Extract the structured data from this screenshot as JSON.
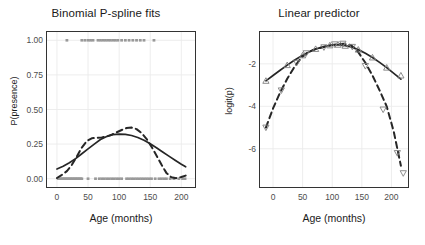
{
  "figure": {
    "background": "#ffffff",
    "panel_border": "#333333",
    "grid_color": "#ebebeb",
    "curve_color": "#262626",
    "rug_color": "#999999",
    "marker_color": "#808080"
  },
  "chart_data": [
    {
      "type": "line",
      "panel": "left",
      "title": "Binomial P-spline fits",
      "xlabel": "Age (months)",
      "ylabel": "P(presence)",
      "xlim": [
        -16,
        222
      ],
      "ylim": [
        -0.06,
        1.06
      ],
      "xticks": [
        0,
        50,
        100,
        150,
        200
      ],
      "xticklabels": [
        "0",
        "50",
        "100",
        "150",
        "200"
      ],
      "yticks": [
        0.0,
        0.25,
        0.5,
        0.75,
        1.0
      ],
      "yticklabels": [
        "0.00",
        "0.25",
        "0.50",
        "0.75",
        "1.00"
      ],
      "grid": true,
      "legend": "none",
      "series": [
        {
          "name": "smooth-fit",
          "style": "solid",
          "x": [
            0,
            10,
            20,
            30,
            40,
            50,
            60,
            70,
            80,
            90,
            100,
            110,
            120,
            130,
            140,
            150,
            160,
            170,
            180,
            190,
            200,
            207
          ],
          "values": [
            0.07,
            0.09,
            0.115,
            0.145,
            0.18,
            0.215,
            0.25,
            0.283,
            0.305,
            0.318,
            0.322,
            0.32,
            0.312,
            0.298,
            0.278,
            0.252,
            0.224,
            0.193,
            0.163,
            0.133,
            0.104,
            0.086
          ]
        },
        {
          "name": "wiggly-fit",
          "style": "dashed",
          "x": [
            0,
            8,
            16,
            24,
            32,
            40,
            48,
            56,
            64,
            72,
            80,
            88,
            96,
            104,
            112,
            120,
            128,
            136,
            144,
            152,
            160,
            168,
            176,
            184,
            192,
            200,
            207
          ],
          "values": [
            0.005,
            0.028,
            0.055,
            0.1,
            0.16,
            0.225,
            0.272,
            0.292,
            0.296,
            0.298,
            0.305,
            0.318,
            0.335,
            0.352,
            0.366,
            0.37,
            0.358,
            0.33,
            0.288,
            0.232,
            0.168,
            0.102,
            0.042,
            0.01,
            0.004,
            0.012,
            0.022
          ]
        }
      ],
      "rug_top": {
        "name": "presence-observations",
        "y": 1.0,
        "x": [
          16,
          40,
          45,
          50,
          54,
          58,
          66,
          70,
          74,
          78,
          82,
          86,
          90,
          94,
          98,
          104,
          110,
          116,
          122,
          128,
          134,
          140,
          156
        ]
      },
      "rug_bottom": {
        "name": "absence-observations",
        "y": 0.0,
        "x": [
          2,
          4,
          6,
          8,
          10,
          12,
          14,
          16,
          18,
          20,
          22,
          24,
          26,
          28,
          30,
          32,
          34,
          36,
          38,
          40,
          50,
          62,
          68,
          72,
          76,
          80,
          84,
          88,
          92,
          96,
          100,
          104,
          112,
          116,
          120,
          124,
          128,
          132,
          136,
          140,
          144,
          148,
          152,
          158,
          164,
          168,
          172,
          176,
          182,
          188,
          196,
          202,
          206
        ]
      }
    },
    {
      "type": "line",
      "panel": "right",
      "title": "Linear predictor",
      "xlabel": "Age (months)",
      "ylabel": "logit(p)",
      "xlim": [
        -22,
        228
      ],
      "ylim": [
        -7.8,
        -0.5
      ],
      "xticks": [
        0,
        50,
        100,
        150,
        200
      ],
      "xticklabels": [
        "0",
        "50",
        "100",
        "150",
        "200"
      ],
      "yticks": [
        -2,
        -4,
        -6
      ],
      "yticklabels": [
        "-2",
        "-4",
        "-6"
      ],
      "grid": true,
      "legend": "none",
      "series": [
        {
          "name": "smooth-linear-predictor",
          "style": "solid",
          "x": [
            -12,
            0,
            12,
            24,
            36,
            48,
            60,
            72,
            84,
            96,
            108,
            120,
            132,
            144,
            156,
            168,
            180,
            192,
            204,
            216
          ],
          "values": [
            -2.8,
            -2.55,
            -2.3,
            -2.06,
            -1.83,
            -1.63,
            -1.45,
            -1.3,
            -1.2,
            -1.13,
            -1.1,
            -1.13,
            -1.2,
            -1.33,
            -1.5,
            -1.7,
            -1.93,
            -2.18,
            -2.45,
            -2.72
          ]
        },
        {
          "name": "wiggly-linear-predictor",
          "style": "dashed",
          "x": [
            -12,
            0,
            12,
            24,
            36,
            48,
            60,
            72,
            84,
            96,
            108,
            120,
            132,
            144,
            156,
            168,
            180,
            192,
            204,
            216
          ],
          "values": [
            -5.0,
            -4.1,
            -3.35,
            -2.7,
            -2.15,
            -1.7,
            -1.44,
            -1.3,
            -1.22,
            -1.14,
            -1.08,
            -1.05,
            -1.12,
            -1.45,
            -1.95,
            -2.55,
            -3.25,
            -4.0,
            -5.2,
            -6.8
          ]
        }
      ],
      "markers_up": {
        "name": "up-triangle-knots",
        "symbol": "triangle-up",
        "x": [
          -12,
          24,
          50,
          72,
          96,
          110,
          122,
          144,
          168,
          192,
          216
        ],
        "values": [
          -2.8,
          -2.06,
          -1.6,
          -1.3,
          -1.13,
          -1.1,
          -1.15,
          -1.33,
          -1.7,
          -2.18,
          -2.55
        ]
      },
      "markers_down": {
        "name": "down-triangle-knots",
        "symbol": "triangle-down",
        "x": [
          -12,
          14,
          40,
          56,
          86,
          104,
          118,
          134,
          156,
          186,
          210,
          220
        ],
        "values": [
          -5.0,
          -3.25,
          -1.95,
          -1.5,
          -1.22,
          -1.08,
          -1.05,
          -1.2,
          -2.1,
          -4.15,
          -6.2,
          -7.15
        ]
      }
    }
  ]
}
